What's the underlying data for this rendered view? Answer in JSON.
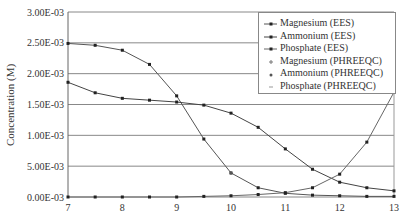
{
  "chart_data": {
    "type": "line",
    "title": "",
    "xlabel": "",
    "ylabel": "Concentration (M)",
    "xlim": [
      7,
      13
    ],
    "ylim": [
      0,
      0.003
    ],
    "x_ticks": [
      "7",
      "8",
      "9",
      "10",
      "11",
      "12",
      "13"
    ],
    "y_ticks": [
      "0.00E-03",
      "5.00E-03",
      "1.00E-03",
      "1.50E-03",
      "2.00E-03",
      "2.50E-03",
      "3.00E-03"
    ],
    "grid": "horizontal",
    "legend_position": "upper right",
    "x": [
      7,
      7.5,
      8,
      8.5,
      9,
      9.5,
      10,
      10.5,
      11,
      11.5,
      12,
      12.5,
      13
    ],
    "series": [
      {
        "name": "Magnesium (EES)",
        "marker": "square",
        "color": "#555555",
        "values": [
          0.00249,
          0.00246,
          0.00238,
          0.00215,
          0.00164,
          0.00094,
          0.00039,
          0.00015,
          6e-05,
          3e-05,
          2e-05,
          1e-05,
          1e-05
        ]
      },
      {
        "name": "Ammonium (EES)",
        "marker": "square",
        "color": "#444444",
        "values": [
          0.00186,
          0.00169,
          0.0016,
          0.00157,
          0.00154,
          0.00149,
          0.00136,
          0.00113,
          0.00078,
          0.00045,
          0.00024,
          0.00015,
          0.0001
        ]
      },
      {
        "name": "Phosphate (EES)",
        "marker": "square",
        "color": "#666666",
        "values": [
          0.0,
          0.0,
          0.0,
          0.0,
          0.0,
          1e-05,
          2e-05,
          4e-05,
          7e-05,
          0.00015,
          0.00037,
          0.00089,
          0.0017
        ]
      },
      {
        "name": "Magnesium (PHREEQC)",
        "marker": "plus",
        "color": "#777777",
        "values": [
          null,
          null,
          null,
          null,
          null,
          null,
          null,
          null,
          null,
          null,
          null,
          null,
          0.00177
        ]
      },
      {
        "name": "Ammonium (PHREEQC)",
        "marker": "star",
        "color": "#555555",
        "values": [
          null,
          null,
          null,
          null,
          null,
          null,
          0.00039,
          null,
          null,
          null,
          null,
          null,
          null
        ]
      },
      {
        "name": "Phosphate (PHREEQC)",
        "marker": "dash",
        "color": "#999999",
        "values": [
          null,
          null,
          null,
          null,
          null,
          null,
          null,
          null,
          null,
          null,
          null,
          null,
          null
        ]
      }
    ]
  }
}
